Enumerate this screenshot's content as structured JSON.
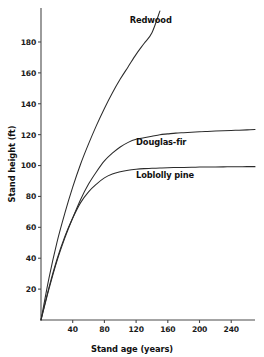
{
  "chart_data": {
    "type": "line",
    "title": "",
    "xlabel": "Stand age (years)",
    "ylabel": "Stand height (ft)",
    "xlim": [
      0,
      270
    ],
    "ylim": [
      0,
      202
    ],
    "xticks": [
      40,
      80,
      120,
      160,
      200,
      240
    ],
    "yticks": [
      20,
      40,
      60,
      80,
      100,
      120,
      140,
      160,
      180
    ],
    "grid": false,
    "legend_position": "inline-annotations",
    "x": [
      0,
      10,
      20,
      30,
      40,
      50,
      60,
      70,
      80,
      90,
      100,
      110,
      120,
      130,
      140,
      150,
      160,
      170,
      180,
      190,
      200,
      210,
      220,
      230,
      240,
      250,
      260,
      270
    ],
    "series": [
      {
        "name": "Redwood",
        "label": "Redwood",
        "label_x": 112,
        "label_y": 192,
        "values": [
          0,
          27,
          50,
          69,
          86,
          101,
          114,
          126,
          137,
          147,
          156,
          164,
          172,
          179,
          186,
          200,
          null,
          null,
          null,
          null,
          null,
          null,
          null,
          null,
          null,
          null,
          null,
          null
        ]
      },
      {
        "name": "Douglas-fir",
        "label": "Douglas-fir",
        "label_x": 120,
        "label_y": 113,
        "values": [
          0,
          20,
          38,
          53,
          66,
          78,
          88,
          96,
          103,
          108,
          112,
          115,
          117,
          118,
          119,
          120,
          120.5,
          121,
          121.3,
          121.6,
          121.9,
          122.1,
          122.3,
          122.5,
          122.7,
          122.9,
          123.1,
          123.3
        ]
      },
      {
        "name": "Loblolly pine",
        "label": "Loblolly pine",
        "label_x": 120,
        "label_y": 92,
        "values": [
          0,
          21,
          39,
          54,
          66,
          76,
          83,
          88,
          92,
          94.5,
          96,
          97,
          97.6,
          98,
          98.2,
          98.4,
          98.6,
          98.7,
          98.8,
          98.9,
          99,
          99.05,
          99.1,
          99.15,
          99.2,
          99.25,
          99.3,
          99.3
        ]
      }
    ]
  },
  "colors": {
    "background": "#ffffff",
    "axis": "#4a4a4a",
    "curve": "#2b2b2b",
    "text": "#111111"
  }
}
